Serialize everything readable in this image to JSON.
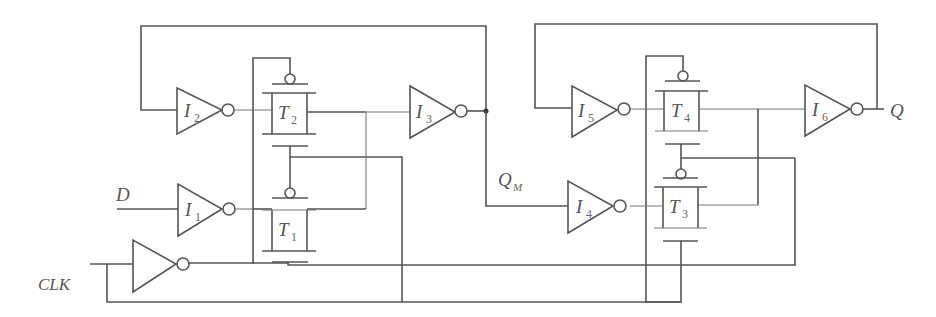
{
  "diagram": {
    "type": "master-slave D flip-flop (transmission gate)",
    "signals": {
      "d": "D",
      "clk": "CLK",
      "qm": "Q",
      "qm_sub": "M",
      "q": "Q"
    },
    "inverters": [
      {
        "id": "I1",
        "main": "I",
        "sub": "1"
      },
      {
        "id": "I2",
        "main": "I",
        "sub": "2"
      },
      {
        "id": "I3",
        "main": "I",
        "sub": "3"
      },
      {
        "id": "I4",
        "main": "I",
        "sub": "4"
      },
      {
        "id": "I5",
        "main": "I",
        "sub": "5"
      },
      {
        "id": "I6",
        "main": "I",
        "sub": "6"
      }
    ],
    "transmission_gates": [
      {
        "id": "T1",
        "main": "T",
        "sub": "1"
      },
      {
        "id": "T2",
        "main": "T",
        "sub": "2"
      },
      {
        "id": "T3",
        "main": "T",
        "sub": "3"
      },
      {
        "id": "T4",
        "main": "T",
        "sub": "4"
      }
    ],
    "colors": {
      "line": "#555555",
      "background": "#ffffff"
    }
  }
}
